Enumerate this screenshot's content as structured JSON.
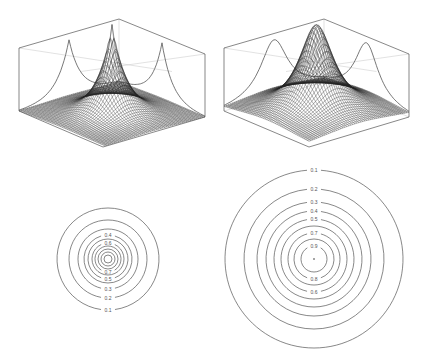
{
  "figure": {
    "width": 427,
    "height": 364,
    "background": "#ffffff",
    "line_color": "#555555",
    "mesh_color": "#222222",
    "back_line_color": "#cfcfcf"
  },
  "chart_data": [
    {
      "id": "surface-left",
      "type": "surface",
      "title": "",
      "function": "laplace-like sharp peak exp(-r/a)",
      "peak_value": 1.0,
      "grid": 50,
      "axis_ticks": "none",
      "box": {
        "top_back": [
          119,
          19
        ],
        "top_left": [
          19,
          48
        ],
        "top_right": [
          205,
          54
        ],
        "bottom_left": [
          19,
          111
        ],
        "bottom_front": [
          103,
          147
        ],
        "bottom_right": [
          205,
          117
        ]
      },
      "peak_screen": [
        111,
        57
      ],
      "side_projection_peaks": [
        [
          69,
          40
        ],
        [
          162,
          42
        ]
      ]
    },
    {
      "id": "surface-right",
      "type": "surface",
      "title": "",
      "function": "smooth gaussian-like peak",
      "peak_value": 1.0,
      "grid": 50,
      "axis_ticks": "none",
      "box": {
        "top_back": [
          324,
          19
        ],
        "top_left": [
          224,
          48
        ],
        "top_right": [
          409,
          54
        ],
        "bottom_left": [
          224,
          111
        ],
        "bottom_front": [
          309,
          147
        ],
        "bottom_right": [
          409,
          117
        ]
      },
      "peak_screen": [
        314,
        57
      ],
      "side_projection_peaks": [
        [
          274,
          40
        ],
        [
          366,
          42
        ]
      ]
    },
    {
      "id": "contour-left",
      "type": "contour",
      "center": [
        108,
        259
      ],
      "levels": [
        0.1,
        0.2,
        0.3,
        0.4,
        0.5,
        0.6,
        0.7,
        0.8,
        0.9,
        1.0
      ],
      "radii": [
        51,
        39,
        30,
        24,
        20,
        16,
        13,
        10,
        7,
        4
      ],
      "labels": [
        {
          "text": "0.1",
          "level": 0.1,
          "pos": "bottom"
        },
        {
          "text": "0.2",
          "level": 0.2,
          "pos": "bottom"
        },
        {
          "text": "0.3",
          "level": 0.3,
          "pos": "bottom"
        },
        {
          "text": "0.4",
          "level": 0.4,
          "pos": "top"
        },
        {
          "text": "0.5",
          "level": 0.5,
          "pos": "bottom"
        },
        {
          "text": "0.6",
          "level": 0.6,
          "pos": "top"
        },
        {
          "text": "0.7",
          "level": 0.7,
          "pos": "bottom"
        }
      ]
    },
    {
      "id": "contour-right",
      "type": "contour",
      "center": [
        314,
        259
      ],
      "levels": [
        0.1,
        0.2,
        0.3,
        0.4,
        0.5,
        0.6,
        0.7,
        0.8,
        0.9
      ],
      "radii": [
        89,
        70,
        57,
        48,
        40,
        33,
        26,
        20,
        13
      ],
      "labels": [
        {
          "text": "0.1",
          "level": 0.1,
          "pos": "top"
        },
        {
          "text": "0.2",
          "level": 0.2,
          "pos": "top"
        },
        {
          "text": "0.3",
          "level": 0.3,
          "pos": "top"
        },
        {
          "text": "0.4",
          "level": 0.4,
          "pos": "top"
        },
        {
          "text": "0.5",
          "level": 0.5,
          "pos": "top"
        },
        {
          "text": "0.7",
          "level": 0.7,
          "pos": "top"
        },
        {
          "text": "0.9",
          "level": 0.9,
          "pos": "top"
        },
        {
          "text": "0.8",
          "level": 0.8,
          "pos": "bottom"
        },
        {
          "text": "0.6",
          "level": 0.6,
          "pos": "bottom"
        }
      ],
      "center_dot": true
    }
  ]
}
